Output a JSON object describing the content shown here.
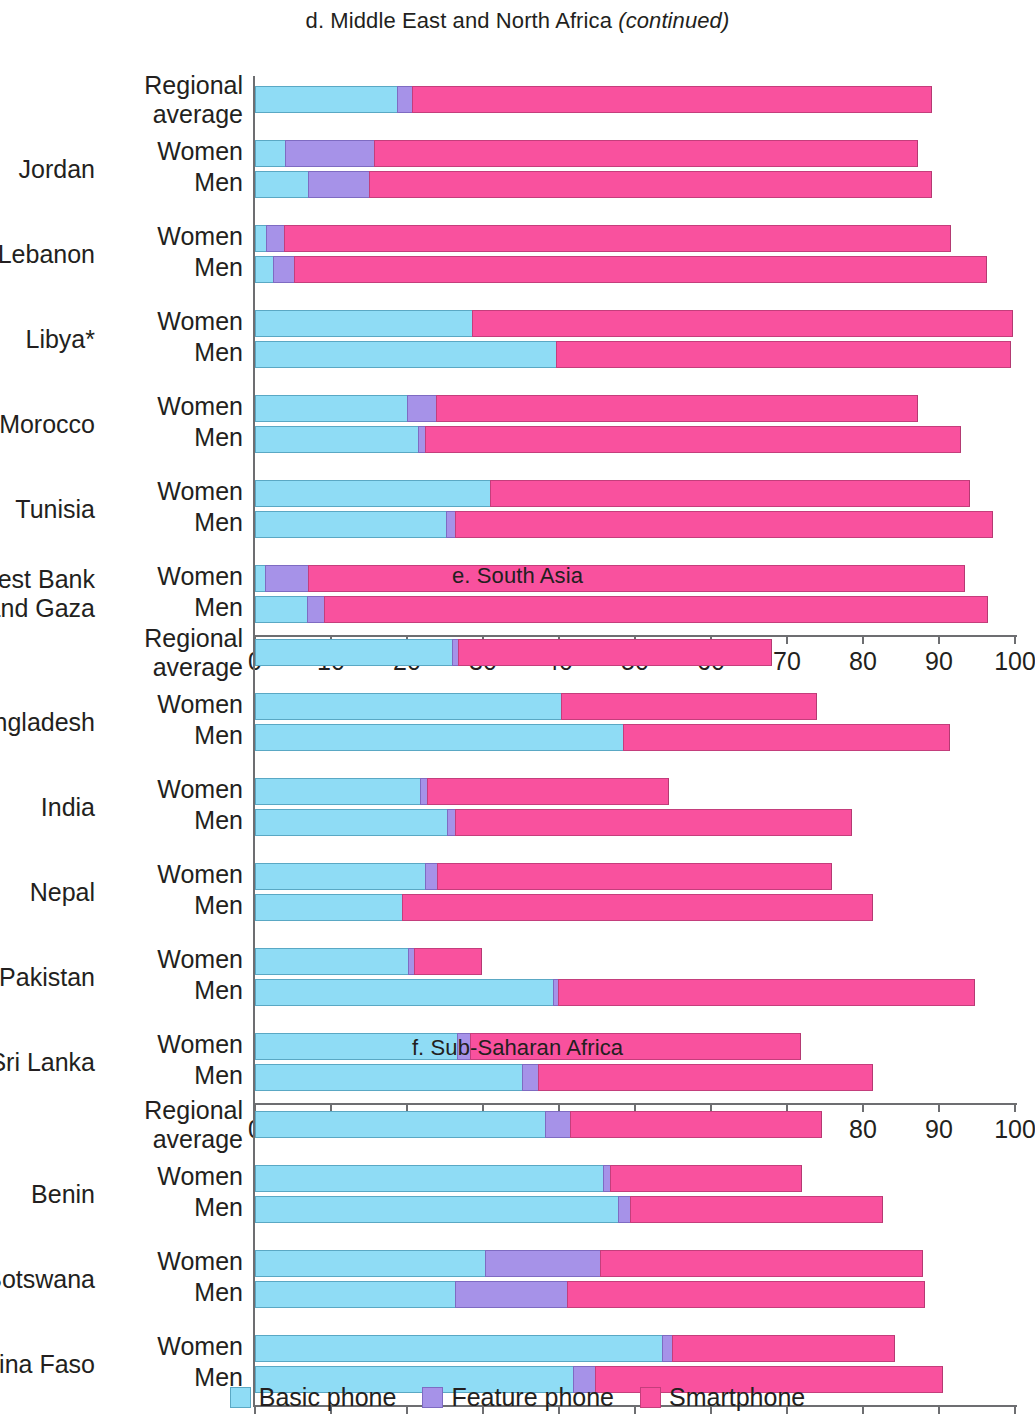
{
  "figure": {
    "legend": [
      {
        "key": "basic",
        "label": "Basic phone",
        "color": "#8fdcf5"
      },
      {
        "key": "feature",
        "label": "Feature phone",
        "color": "#a692e8"
      },
      {
        "key": "smart",
        "label": "Smartphone",
        "color": "#f9519e"
      }
    ],
    "axis": {
      "ticks": [
        "0",
        "10",
        "20",
        "30",
        "40",
        "50",
        "60",
        "70",
        "80",
        "90",
        "100"
      ],
      "min": 0,
      "max": 100
    },
    "sex_labels": {
      "women": "Women",
      "men": "Men"
    },
    "regional_average_label": "Regional\naverage"
  },
  "chart_data": [
    {
      "type": "bar",
      "panel_id": "d",
      "title": "d. Middle East and North Africa",
      "title_suffix": "(continued)",
      "orientation": "horizontal",
      "stacked": true,
      "series": [
        "Basic phone",
        "Feature phone",
        "Smartphone"
      ],
      "xlabel": "",
      "ylabel": "",
      "xlim": [
        0,
        100
      ],
      "xticks": [
        0,
        10,
        20,
        30,
        40,
        50,
        60,
        70,
        80,
        90,
        100
      ],
      "grid": false,
      "legend_position": "bottom",
      "rows": [
        {
          "group": "Regional\naverage",
          "sex": "",
          "basic": 18.7,
          "feature": 2.0,
          "smart": 68.4,
          "total": 89.1
        },
        {
          "group": "Jordan",
          "sex": "Women",
          "basic": 3.9,
          "feature": 11.8,
          "smart": 71.5,
          "total": 87.2
        },
        {
          "group": "Jordan",
          "sex": "Men",
          "basic": 7.0,
          "feature": 8.0,
          "smart": 74.1,
          "total": 89.1
        },
        {
          "group": "Lebanon",
          "sex": "Women",
          "basic": 1.4,
          "feature": 2.4,
          "smart": 87.8,
          "total": 91.6
        },
        {
          "group": "Lebanon",
          "sex": "Men",
          "basic": 2.4,
          "feature": 2.7,
          "smart": 91.2,
          "total": 96.3
        },
        {
          "group": "Libya*",
          "sex": "Women",
          "basic": 28.6,
          "feature": 0.0,
          "smart": 71.1,
          "total": 99.7
        },
        {
          "group": "Libya*",
          "sex": "Men",
          "basic": 39.6,
          "feature": 0.0,
          "smart": 59.9,
          "total": 99.5
        },
        {
          "group": "Morocco",
          "sex": "Women",
          "basic": 20.0,
          "feature": 3.8,
          "smart": 63.4,
          "total": 87.2
        },
        {
          "group": "Morocco",
          "sex": "Men",
          "basic": 21.4,
          "feature": 1.0,
          "smart": 70.5,
          "total": 92.9
        },
        {
          "group": "Tunisia",
          "sex": "Women",
          "basic": 30.9,
          "feature": 0.0,
          "smart": 63.2,
          "total": 94.1
        },
        {
          "group": "Tunisia",
          "sex": "Men",
          "basic": 25.1,
          "feature": 1.2,
          "smart": 70.8,
          "total": 97.1
        },
        {
          "group": "West Bank\nand Gaza",
          "sex": "Women",
          "basic": 1.3,
          "feature": 5.7,
          "smart": 86.4,
          "total": 93.4
        },
        {
          "group": "West Bank\nand Gaza",
          "sex": "Men",
          "basic": 6.8,
          "feature": 2.3,
          "smart": 87.3,
          "total": 96.4
        }
      ]
    },
    {
      "type": "bar",
      "panel_id": "e",
      "title": "e. South Asia",
      "title_suffix": "",
      "orientation": "horizontal",
      "stacked": true,
      "series": [
        "Basic phone",
        "Feature phone",
        "Smartphone"
      ],
      "xlabel": "",
      "ylabel": "",
      "xlim": [
        0,
        100
      ],
      "xticks": [
        0,
        10,
        20,
        30,
        40,
        50,
        60,
        70,
        80,
        90,
        100
      ],
      "grid": false,
      "legend_position": "bottom",
      "rows": [
        {
          "group": "Regional\naverage",
          "sex": "",
          "basic": 25.9,
          "feature": 0.8,
          "smart": 41.3,
          "total": 68.0
        },
        {
          "group": "Bangladesh",
          "sex": "Women",
          "basic": 40.3,
          "feature": 0.0,
          "smart": 33.6,
          "total": 73.9
        },
        {
          "group": "Bangladesh",
          "sex": "Men",
          "basic": 48.4,
          "feature": 0.0,
          "smart": 43.0,
          "total": 91.4
        },
        {
          "group": "India",
          "sex": "Women",
          "basic": 21.7,
          "feature": 0.9,
          "smart": 31.9,
          "total": 54.5
        },
        {
          "group": "India",
          "sex": "Men",
          "basic": 25.3,
          "feature": 1.0,
          "smart": 52.3,
          "total": 78.6
        },
        {
          "group": "Nepal",
          "sex": "Women",
          "basic": 22.4,
          "feature": 1.6,
          "smart": 51.9,
          "total": 75.9
        },
        {
          "group": "Nepal",
          "sex": "Men",
          "basic": 19.3,
          "feature": 0.0,
          "smart": 62.0,
          "total": 81.3
        },
        {
          "group": "Pakistan",
          "sex": "Women",
          "basic": 20.1,
          "feature": 0.8,
          "smart": 9.0,
          "total": 29.9
        },
        {
          "group": "Pakistan",
          "sex": "Men",
          "basic": 39.2,
          "feature": 0.7,
          "smart": 54.8,
          "total": 94.7
        },
        {
          "group": "Sri Lanka",
          "sex": "Women",
          "basic": 26.6,
          "feature": 1.7,
          "smart": 43.5,
          "total": 71.8
        },
        {
          "group": "Sri Lanka",
          "sex": "Men",
          "basic": 35.1,
          "feature": 2.1,
          "smart": 44.1,
          "total": 81.3
        }
      ]
    },
    {
      "type": "bar",
      "panel_id": "f",
      "title": "f. Sub-Saharan Africa",
      "title_suffix": "",
      "orientation": "horizontal",
      "stacked": true,
      "series": [
        "Basic phone",
        "Feature phone",
        "Smartphone"
      ],
      "xlabel": "",
      "ylabel": "",
      "xlim": [
        0,
        100
      ],
      "xticks": [
        0,
        10,
        20,
        30,
        40,
        50,
        60,
        70,
        80,
        90,
        100
      ],
      "grid": false,
      "legend_position": "bottom",
      "rows": [
        {
          "group": "Regional\naverage",
          "sex": "",
          "basic": 38.2,
          "feature": 3.2,
          "smart": 33.2,
          "total": 74.6
        },
        {
          "group": "Benin",
          "sex": "Women",
          "basic": 45.8,
          "feature": 0.9,
          "smart": 25.3,
          "total": 72.0
        },
        {
          "group": "Benin",
          "sex": "Men",
          "basic": 47.8,
          "feature": 1.5,
          "smart": 33.3,
          "total": 82.6
        },
        {
          "group": "Botswana",
          "sex": "Women",
          "basic": 30.3,
          "feature": 15.1,
          "smart": 42.5,
          "total": 87.9
        },
        {
          "group": "Botswana",
          "sex": "Men",
          "basic": 26.3,
          "feature": 14.8,
          "smart": 47.1,
          "total": 88.2
        },
        {
          "group": "Burkina Faso",
          "sex": "Women",
          "basic": 53.6,
          "feature": 1.3,
          "smart": 29.3,
          "total": 84.2
        },
        {
          "group": "Burkina Faso",
          "sex": "Men",
          "basic": 41.8,
          "feature": 2.9,
          "smart": 45.8,
          "total": 90.5
        }
      ]
    }
  ]
}
